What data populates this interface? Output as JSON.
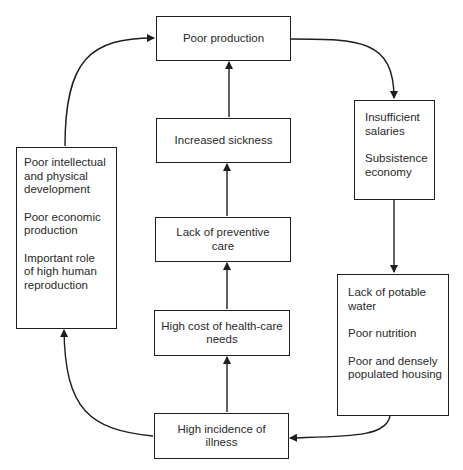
{
  "diagram": {
    "type": "cycle-flow",
    "nodes": {
      "poor_production": {
        "text": "Poor production"
      },
      "increased_sickness": {
        "text": "Increased sickness"
      },
      "lack_preventive": {
        "line1": "Lack of preventive",
        "line2": "care"
      },
      "high_cost": {
        "line1": "High cost of health-care",
        "line2": "needs"
      },
      "high_incidence": {
        "line1": "High incidence of",
        "line2": "illness"
      },
      "left_box": {
        "items": [
          {
            "lines": [
              "Poor intellectual",
              "and physical",
              "development"
            ]
          },
          {
            "lines": [
              "Poor economic",
              "production"
            ]
          },
          {
            "lines": [
              "Important role",
              "of high human",
              "reproduction"
            ]
          }
        ]
      },
      "right_upper_box": {
        "items": [
          {
            "lines": [
              "Insufficient",
              "salaries"
            ]
          },
          {
            "lines": [
              "Subsistence",
              "economy"
            ]
          }
        ]
      },
      "right_lower_box": {
        "items": [
          {
            "lines": [
              "Lack of potable",
              "water"
            ]
          },
          {
            "lines": [
              "Poor nutrition"
            ]
          },
          {
            "lines": [
              "Poor and densely",
              "populated housing"
            ]
          }
        ]
      }
    },
    "edges": [
      {
        "from": "poor_production",
        "to": "right_upper_box"
      },
      {
        "from": "right_upper_box",
        "to": "right_lower_box"
      },
      {
        "from": "right_lower_box",
        "to": "high_incidence"
      },
      {
        "from": "high_incidence",
        "to": "high_cost"
      },
      {
        "from": "high_cost",
        "to": "lack_preventive"
      },
      {
        "from": "lack_preventive",
        "to": "increased_sickness"
      },
      {
        "from": "increased_sickness",
        "to": "poor_production"
      },
      {
        "from": "high_incidence",
        "to": "left_box"
      },
      {
        "from": "left_box",
        "to": "poor_production"
      }
    ]
  }
}
